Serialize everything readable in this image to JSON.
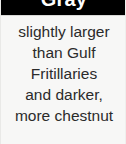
{
  "card": {
    "header": {
      "title": "Gray",
      "background_color": "#000000",
      "text_color": "#ffffff"
    },
    "background_color": "#f7f7f6",
    "body": {
      "text_color": "#2b2b2b",
      "lines": [
        "slightly larger",
        "than Gulf",
        "Fritillaries",
        "and darker,",
        "more chestnut"
      ]
    }
  }
}
